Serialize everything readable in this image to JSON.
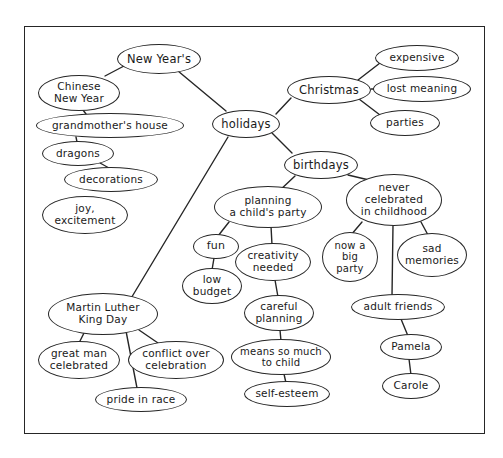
{
  "diagram": {
    "kind": "concept-map",
    "title_visible": false,
    "background_color": "#ffffff",
    "stroke_color": "#262626",
    "text_color": "#1a1a1a",
    "frame": {
      "x": 24,
      "y": 26,
      "width": 461,
      "height": 408
    },
    "root": "holidays",
    "nodes": [
      {
        "id": "new-years",
        "label": "New Year's",
        "x": 117,
        "y": 44,
        "w": 84,
        "h": 30,
        "fs": 11.5
      },
      {
        "id": "chinese-new-year",
        "label": "Chinese\nNew Year",
        "x": 38,
        "y": 75,
        "w": 82,
        "h": 36,
        "fs": 10.5
      },
      {
        "id": "grandmothers-house",
        "label": "grandmother's house",
        "x": 36,
        "y": 113,
        "w": 148,
        "h": 25,
        "fs": 10.5
      },
      {
        "id": "dragons",
        "label": "dragons",
        "x": 42,
        "y": 141,
        "w": 72,
        "h": 25,
        "fs": 10.5
      },
      {
        "id": "decorations",
        "label": "decorations",
        "x": 64,
        "y": 167,
        "w": 94,
        "h": 25,
        "fs": 10.5
      },
      {
        "id": "joy-excitement",
        "label": "joy,\nexcitement",
        "x": 42,
        "y": 196,
        "w": 86,
        "h": 38,
        "fs": 10.5
      },
      {
        "id": "holidays",
        "label": "holidays",
        "x": 212,
        "y": 110,
        "w": 68,
        "h": 28,
        "fs": 11.5
      },
      {
        "id": "christmas",
        "label": "Christmas",
        "x": 287,
        "y": 76,
        "w": 84,
        "h": 28,
        "fs": 11.5
      },
      {
        "id": "expensive",
        "label": "expensive",
        "x": 375,
        "y": 45,
        "w": 84,
        "h": 26,
        "fs": 10.5
      },
      {
        "id": "lost-meaning",
        "label": "lost meaning",
        "x": 373,
        "y": 76,
        "w": 98,
        "h": 26,
        "fs": 10.5
      },
      {
        "id": "parties",
        "label": "parties",
        "x": 370,
        "y": 110,
        "w": 70,
        "h": 26,
        "fs": 10.5
      },
      {
        "id": "birthdays",
        "label": "birthdays",
        "x": 284,
        "y": 151,
        "w": 74,
        "h": 28,
        "fs": 11.5
      },
      {
        "id": "planning-party",
        "label": "planning\na child's party",
        "x": 214,
        "y": 186,
        "w": 108,
        "h": 42,
        "fs": 10.5
      },
      {
        "id": "fun",
        "label": "fun",
        "x": 193,
        "y": 234,
        "w": 46,
        "h": 25,
        "fs": 11
      },
      {
        "id": "low-budget",
        "label": "low\nbudget",
        "x": 182,
        "y": 268,
        "w": 60,
        "h": 36,
        "fs": 10.5
      },
      {
        "id": "creativity-needed",
        "label": "creativity\nneeded",
        "x": 235,
        "y": 243,
        "w": 76,
        "h": 38,
        "fs": 10.5
      },
      {
        "id": "careful-planning",
        "label": "careful\nplanning",
        "x": 244,
        "y": 295,
        "w": 70,
        "h": 36,
        "fs": 10.5
      },
      {
        "id": "means-so-much",
        "label": "means so much\nto child",
        "x": 231,
        "y": 339,
        "w": 100,
        "h": 36,
        "fs": 10
      },
      {
        "id": "self-esteem",
        "label": "self-esteem",
        "x": 244,
        "y": 381,
        "w": 86,
        "h": 26,
        "fs": 10.5
      },
      {
        "id": "never-celebrated",
        "label": "never\ncelebrated\nin childhood",
        "x": 346,
        "y": 174,
        "w": 96,
        "h": 52,
        "fs": 10.5
      },
      {
        "id": "now-a-big-party",
        "label": "now a\nbig\nparty",
        "x": 322,
        "y": 232,
        "w": 56,
        "h": 50,
        "fs": 10
      },
      {
        "id": "sad-memories",
        "label": "sad\nmemories",
        "x": 397,
        "y": 233,
        "w": 70,
        "h": 44,
        "fs": 10.5
      },
      {
        "id": "adult-friends",
        "label": "adult friends",
        "x": 351,
        "y": 294,
        "w": 94,
        "h": 26,
        "fs": 10.5
      },
      {
        "id": "pamela",
        "label": "Pamela",
        "x": 380,
        "y": 334,
        "w": 62,
        "h": 26,
        "fs": 10.5
      },
      {
        "id": "carole",
        "label": "Carole",
        "x": 382,
        "y": 373,
        "w": 58,
        "h": 26,
        "fs": 10.5
      },
      {
        "id": "mlk-day",
        "label": "Martin Luther\nKing Day",
        "x": 48,
        "y": 293,
        "w": 110,
        "h": 42,
        "fs": 10.5
      },
      {
        "id": "great-man",
        "label": "great man\ncelebrated",
        "x": 38,
        "y": 341,
        "w": 82,
        "h": 38,
        "fs": 10.5
      },
      {
        "id": "conflict-over",
        "label": "conflict over\ncelebration",
        "x": 128,
        "y": 341,
        "w": 96,
        "h": 38,
        "fs": 10.5
      },
      {
        "id": "pride-in-race",
        "label": "pride in race",
        "x": 95,
        "y": 387,
        "w": 92,
        "h": 25,
        "fs": 10.5
      }
    ],
    "edges": [
      {
        "from": "new-years",
        "to": "chinese-new-year",
        "x1": 124,
        "y1": 66,
        "x2": 105,
        "y2": 76
      },
      {
        "from": "new-years",
        "to": "holidays",
        "x1": 178,
        "y1": 71,
        "x2": 226,
        "y2": 111
      },
      {
        "from": "chinese-new-year",
        "to": "grandmothers-house",
        "x1": 83,
        "y1": 110,
        "x2": 86,
        "y2": 114
      },
      {
        "from": "grandmothers-house",
        "to": "dragons",
        "x1": 76,
        "y1": 137,
        "x2": 77,
        "y2": 142
      },
      {
        "from": "dragons",
        "to": "decorations",
        "x1": 100,
        "y1": 163,
        "x2": 109,
        "y2": 168
      },
      {
        "from": "holidays",
        "to": "christmas",
        "x1": 276,
        "y1": 114,
        "x2": 291,
        "y2": 98
      },
      {
        "from": "christmas",
        "to": "expensive",
        "x1": 358,
        "y1": 80,
        "x2": 380,
        "y2": 63
      },
      {
        "from": "christmas",
        "to": "lost-meaning",
        "x1": 371,
        "y1": 89,
        "x2": 374,
        "y2": 89
      },
      {
        "from": "christmas",
        "to": "parties",
        "x1": 359,
        "y1": 99,
        "x2": 380,
        "y2": 115
      },
      {
        "from": "holidays",
        "to": "birthdays",
        "x1": 272,
        "y1": 133,
        "x2": 292,
        "y2": 153
      },
      {
        "from": "holidays",
        "to": "mlk-day",
        "x1": 228,
        "y1": 137,
        "x2": 130,
        "y2": 300
      },
      {
        "from": "birthdays",
        "to": "planning-party",
        "x1": 295,
        "y1": 176,
        "x2": 278,
        "y2": 192
      },
      {
        "from": "birthdays",
        "to": "never-celebrated",
        "x1": 348,
        "y1": 175,
        "x2": 369,
        "y2": 180
      },
      {
        "from": "planning-party",
        "to": "fun",
        "x1": 229,
        "y1": 222,
        "x2": 218,
        "y2": 236
      },
      {
        "from": "fun",
        "to": "low-budget",
        "x1": 214,
        "y1": 258,
        "x2": 212,
        "y2": 270
      },
      {
        "from": "planning-party",
        "to": "creativity-needed",
        "x1": 271,
        "y1": 226,
        "x2": 272,
        "y2": 245
      },
      {
        "from": "creativity-needed",
        "to": "careful-planning",
        "x1": 275,
        "y1": 280,
        "x2": 278,
        "y2": 297
      },
      {
        "from": "careful-planning",
        "to": "means-so-much",
        "x1": 280,
        "y1": 330,
        "x2": 281,
        "y2": 341
      },
      {
        "from": "means-so-much",
        "to": "self-esteem",
        "x1": 284,
        "y1": 374,
        "x2": 286,
        "y2": 383
      },
      {
        "from": "never-celebrated",
        "to": "now-a-big-party",
        "x1": 362,
        "y1": 222,
        "x2": 351,
        "y2": 235
      },
      {
        "from": "never-celebrated",
        "to": "sad-memories",
        "x1": 421,
        "y1": 222,
        "x2": 428,
        "y2": 235
      },
      {
        "from": "never-celebrated",
        "to": "adult-friends",
        "x1": 393,
        "y1": 225,
        "x2": 392,
        "y2": 296
      },
      {
        "from": "adult-friends",
        "to": "pamela",
        "x1": 401,
        "y1": 319,
        "x2": 408,
        "y2": 336
      },
      {
        "from": "pamela",
        "to": "carole",
        "x1": 409,
        "y1": 359,
        "x2": 411,
        "y2": 375
      },
      {
        "from": "mlk-day",
        "to": "great-man",
        "x1": 84,
        "y1": 333,
        "x2": 79,
        "y2": 343
      },
      {
        "from": "mlk-day",
        "to": "conflict-over",
        "x1": 139,
        "y1": 330,
        "x2": 158,
        "y2": 343
      },
      {
        "from": "mlk-day",
        "to": "pride-in-race",
        "x1": 126,
        "y1": 331,
        "x2": 137,
        "y2": 388
      }
    ]
  }
}
